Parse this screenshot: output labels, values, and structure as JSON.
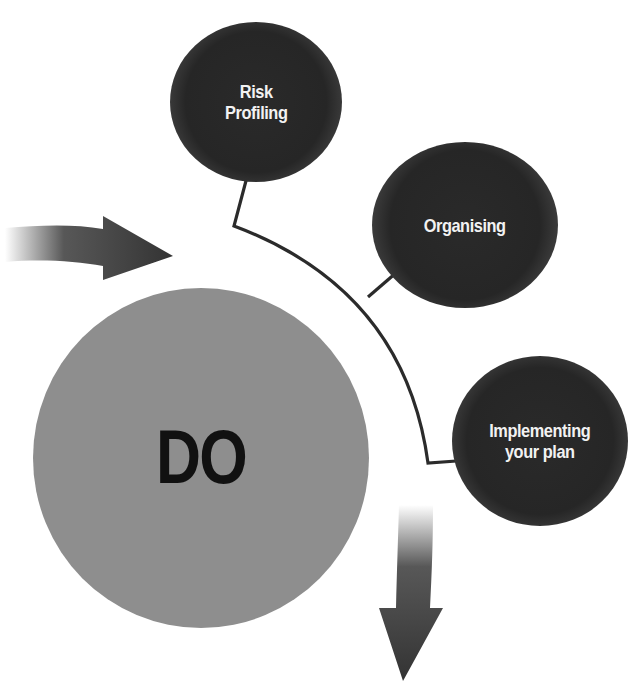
{
  "diagram": {
    "center": {
      "label": "DO",
      "color": "#8e8e8e"
    },
    "steps": [
      {
        "label_line1": "Risk",
        "label_line2": "Profiling"
      },
      {
        "label_line1": "Organising",
        "label_line2": ""
      },
      {
        "label_line1": "Implementing",
        "label_line2": "your plan"
      }
    ],
    "arrows": [
      {
        "name": "incoming-arrow",
        "direction": "right"
      },
      {
        "name": "outgoing-arrow",
        "direction": "down"
      }
    ],
    "colors": {
      "step_fill": "#262626",
      "step_text": "#f2f2f2",
      "connector": "#2b2b2b",
      "arrow": "#3a3a3a"
    }
  }
}
